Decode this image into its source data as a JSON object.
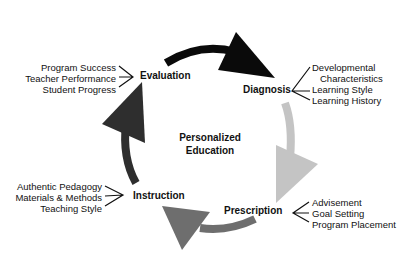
{
  "center": {
    "line1": "Personalized",
    "line2": "Education"
  },
  "stages": {
    "evaluation": {
      "label": "Evaluation",
      "items": [
        "Program Success",
        "Teacher Performance",
        "Student Progress"
      ]
    },
    "diagnosis": {
      "label": "Diagnosis",
      "items": [
        "Developmental",
        "Characteristics",
        "Learning Style",
        "Learning History"
      ]
    },
    "prescription": {
      "label": "Prescription",
      "items": [
        "Advisement",
        "Goal Setting",
        "Program Placement"
      ]
    },
    "instruction": {
      "label": "Instruction",
      "items": [
        "Authentic Pedagogy",
        "Materials & Methods",
        "Teaching Style"
      ]
    }
  },
  "colors": {
    "evaluation_to_diagnosis": "#0a0a0a",
    "diagnosis_to_prescription": "#c4c4c4",
    "prescription_to_instruction": "#6e6e6e",
    "instruction_to_evaluation": "#2e2e2e"
  }
}
